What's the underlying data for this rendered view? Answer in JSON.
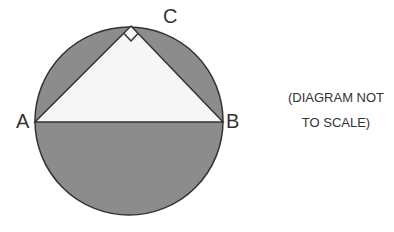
{
  "diagram": {
    "shapes": {
      "circle": {
        "cx": 129,
        "cy": 121,
        "r": 94,
        "fill": "#8c8c8c",
        "stroke": "#333333"
      },
      "triangle": {
        "points": "35,122 223,122 131,26",
        "fill": "#f6f6f6",
        "stroke": "#333333"
      },
      "right_angle_marker": {
        "vertex": "C"
      }
    },
    "labels": {
      "A": "A",
      "B": "B",
      "C": "C"
    },
    "note": {
      "line1": "(DIAGRAM NOT",
      "line2": "TO SCALE)"
    }
  }
}
